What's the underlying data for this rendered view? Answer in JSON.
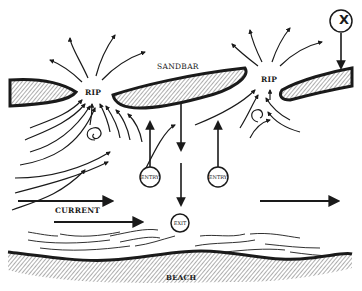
{
  "diagram": {
    "labels": {
      "sandbar": "SANDBAR",
      "rip_left": "RIP",
      "rip_right": "RIP",
      "current": "CURRENT",
      "beach": "BEACH"
    },
    "markers": {
      "entry_left": "ENTRY",
      "entry_right": "ENTRY",
      "exit": "EXIT",
      "danger": "X"
    },
    "colors": {
      "ink": "#1a1a1a",
      "background": "#ffffff"
    }
  }
}
